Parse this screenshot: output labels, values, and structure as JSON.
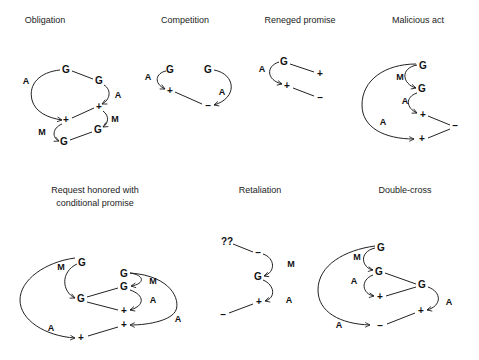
{
  "diagrams": [
    {
      "id": "obligation",
      "title": "Obligation",
      "nodes": [
        "G",
        "G",
        "+",
        "+",
        "G",
        "G"
      ],
      "labels": [
        "A",
        "A",
        "M",
        "M"
      ]
    },
    {
      "id": "competition",
      "title": "Competition",
      "nodes": [
        "G",
        "+",
        "G",
        "–"
      ],
      "labels": [
        "A",
        "A"
      ]
    },
    {
      "id": "reneged-promise",
      "title": "Reneged promise",
      "nodes": [
        "G",
        "+",
        "+",
        "–"
      ],
      "labels": [
        "A"
      ]
    },
    {
      "id": "malicious-act",
      "title": "Malicious act",
      "nodes": [
        "G",
        "G",
        "+",
        "–",
        "+"
      ],
      "labels": [
        "M",
        "A",
        "A"
      ]
    },
    {
      "id": "request-honored",
      "title_line1": "Request honored with",
      "title_line2": "conditional promise",
      "nodes": [
        "G",
        "G",
        "G",
        "G",
        "+",
        "+",
        "+"
      ],
      "labels": [
        "M",
        "M",
        "A",
        "A",
        "A"
      ]
    },
    {
      "id": "retaliation",
      "title": "Retaliation",
      "nodes": [
        "??",
        "–",
        "G",
        "+",
        "–"
      ],
      "labels": [
        "M",
        "A"
      ]
    },
    {
      "id": "double-cross",
      "title": "Double-cross",
      "nodes": [
        "G",
        "G",
        "G",
        "+",
        "+",
        "–"
      ],
      "labels": [
        "M",
        "A",
        "A",
        "A"
      ]
    }
  ]
}
